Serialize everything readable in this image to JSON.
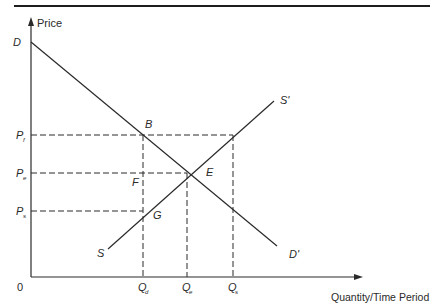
{
  "diagram": {
    "type": "supply-demand-price-floor",
    "axes": {
      "y_label": "Price",
      "x_label": "Quantity/Time Period",
      "origin_label": "0"
    },
    "curves": {
      "demand": {
        "start_label": "D",
        "end_label": "D'"
      },
      "supply": {
        "start_label": "S",
        "end_label": "S'"
      }
    },
    "price_levels": [
      {
        "label": "P",
        "sub": "f"
      },
      {
        "label": "P",
        "sub": "e"
      },
      {
        "label": "P",
        "sub": "s"
      }
    ],
    "quantity_levels": [
      {
        "label": "Q",
        "sub": "d"
      },
      {
        "label": "Q",
        "sub": "e"
      },
      {
        "label": "Q",
        "sub": "s"
      }
    ],
    "points": {
      "B": "B",
      "E": "E",
      "F": "F",
      "G": "G"
    },
    "colors": {
      "line": "#2a2a2a",
      "background": "#ffffff"
    }
  }
}
